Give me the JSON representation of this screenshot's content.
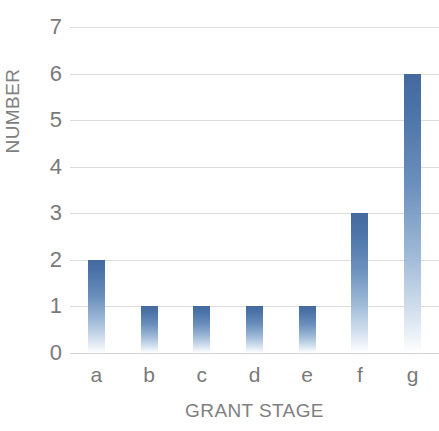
{
  "chart_data": {
    "type": "bar",
    "title": "",
    "subtitle": "",
    "categories": [
      "a",
      "b",
      "c",
      "d",
      "e",
      "f",
      "g"
    ],
    "values": [
      2,
      1,
      1,
      1,
      1,
      3,
      6
    ],
    "series": [
      {
        "name": "NUMBER",
        "values": [
          2,
          1,
          1,
          1,
          1,
          3,
          6
        ]
      }
    ],
    "xlabel": "GRANT STAGE",
    "ylabel": "NUMBER",
    "ylim": [
      0,
      7
    ],
    "y_ticks": [
      0,
      1,
      2,
      3,
      4,
      5,
      6,
      7
    ],
    "y_tick_labels": [
      "0",
      "1",
      "2",
      "3",
      "4",
      "5",
      "6",
      "7"
    ],
    "x_tick_labels": [
      "a",
      "b",
      "c",
      "d",
      "e",
      "f",
      "g"
    ],
    "grid": "horizontal",
    "legend": "none",
    "bar_color_top": "#44699e",
    "bar_color_bottom": "#ffffff",
    "gridline_color": "#dcdcdc",
    "axis_label_color": "#808080",
    "tick_label_color": "#7a7a7a",
    "background_color": "#ffffff"
  }
}
